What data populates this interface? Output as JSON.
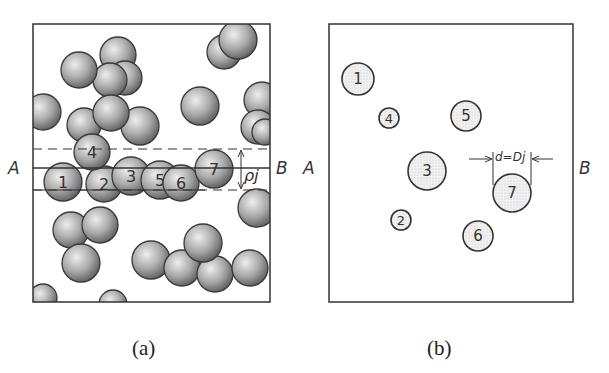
{
  "figure": {
    "panel_a": {
      "caption": "(a)",
      "left_label": "A",
      "right_label": "B",
      "thickness_label": "ρj",
      "numbered_spheres": [
        {
          "n": "1",
          "cx": 63,
          "cy": 182,
          "r": 19
        },
        {
          "n": "2",
          "cx": 104,
          "cy": 184,
          "r": 18
        },
        {
          "n": "3",
          "cx": 131,
          "cy": 176,
          "r": 19
        },
        {
          "n": "4",
          "cx": 92,
          "cy": 152,
          "r": 18
        },
        {
          "n": "5",
          "cx": 160,
          "cy": 180,
          "r": 19
        },
        {
          "n": "6",
          "cx": 181,
          "cy": 183,
          "r": 18
        },
        {
          "n": "7",
          "cx": 214,
          "cy": 169,
          "r": 19
        }
      ],
      "other_spheres": [
        {
          "cx": 224,
          "cy": 52,
          "r": 17
        },
        {
          "cx": 238,
          "cy": 40,
          "r": 19
        },
        {
          "cx": 118,
          "cy": 55,
          "r": 18
        },
        {
          "cx": 125,
          "cy": 78,
          "r": 17
        },
        {
          "cx": 110,
          "cy": 80,
          "r": 17
        },
        {
          "cx": 79,
          "cy": 70,
          "r": 18
        },
        {
          "cx": 43,
          "cy": 112,
          "r": 18
        },
        {
          "cx": 200,
          "cy": 106,
          "r": 19
        },
        {
          "cx": 262,
          "cy": 100,
          "r": 18
        },
        {
          "cx": 258,
          "cy": 127,
          "r": 17
        },
        {
          "cx": 265,
          "cy": 132,
          "r": 13
        },
        {
          "cx": 84,
          "cy": 125,
          "r": 17
        },
        {
          "cx": 140,
          "cy": 126,
          "r": 19
        },
        {
          "cx": 111,
          "cy": 113,
          "r": 18
        },
        {
          "cx": 257,
          "cy": 208,
          "r": 19
        },
        {
          "cx": 71,
          "cy": 230,
          "r": 18
        },
        {
          "cx": 100,
          "cy": 225,
          "r": 18
        },
        {
          "cx": 81,
          "cy": 263,
          "r": 19
        },
        {
          "cx": 151,
          "cy": 260,
          "r": 19
        },
        {
          "cx": 182,
          "cy": 268,
          "r": 18
        },
        {
          "cx": 215,
          "cy": 274,
          "r": 18
        },
        {
          "cx": 203,
          "cy": 243,
          "r": 19
        },
        {
          "cx": 250,
          "cy": 268,
          "r": 18
        },
        {
          "cx": 43,
          "cy": 298,
          "r": 14
        },
        {
          "cx": 113,
          "cy": 304,
          "r": 14
        }
      ]
    },
    "panel_b": {
      "caption": "(b)",
      "left_label": "A",
      "right_label": "B",
      "dimension_label": "d=Dj",
      "sections": [
        {
          "n": "1",
          "cx": 358,
          "cy": 79,
          "r": 16
        },
        {
          "n": "2",
          "cx": 401,
          "cy": 220,
          "r": 10
        },
        {
          "n": "3",
          "cx": 427,
          "cy": 171,
          "r": 19
        },
        {
          "n": "4",
          "cx": 389,
          "cy": 118,
          "r": 10
        },
        {
          "n": "5",
          "cx": 466,
          "cy": 116,
          "r": 15
        },
        {
          "n": "6",
          "cx": 478,
          "cy": 236,
          "r": 15
        },
        {
          "n": "7",
          "cx": 512,
          "cy": 193,
          "r": 19
        }
      ]
    },
    "colors": {
      "ink": "#333333",
      "sphere_light": "#e4e4e4",
      "sphere_dark": "#6e6e6e",
      "section_fill": "#ececec"
    }
  }
}
